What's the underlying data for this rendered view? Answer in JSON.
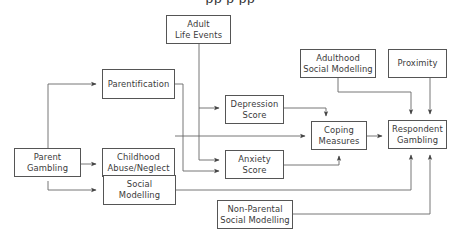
{
  "caption": "pp                  p                  pp",
  "colors": {
    "line": "#555555",
    "text": "#3a3a3a",
    "background": "#ffffff"
  },
  "nodes": {
    "adult_life_events": {
      "label": "Adult\nLife Events"
    },
    "parentification": {
      "label": "Parentification"
    },
    "parent_gambling": {
      "label": "Parent\nGambling"
    },
    "childhood_abuse": {
      "label": "Childhood\nAbuse/Neglect"
    },
    "social_modelling": {
      "label": "Social\nModelling"
    },
    "depression_score": {
      "label": "Depression\nScore"
    },
    "anxiety_score": {
      "label": "Anxiety\nScore"
    },
    "coping_measures": {
      "label": "Coping\nMeasures"
    },
    "respondent_gambling": {
      "label": "Respondent\nGambling"
    },
    "adulthood_social_modelling": {
      "label": "Adulthood\nSocial Modelling"
    },
    "proximity": {
      "label": "Proximity"
    },
    "non_parental_social_modelling": {
      "label": "Non-Parental\nSocial Modelling"
    }
  },
  "edges": [
    {
      "from": "Parent Gambling",
      "to": "Parentification"
    },
    {
      "from": "Parent Gambling",
      "to": "Childhood Abuse/Neglect"
    },
    {
      "from": "Parent Gambling",
      "to": "Social Modelling"
    },
    {
      "from": "Adult Life Events",
      "to": "Depression Score"
    },
    {
      "from": "Adult Life Events",
      "to": "Anxiety Score"
    },
    {
      "from": "Parentification",
      "to": "Anxiety Score"
    },
    {
      "from": "Childhood Abuse/Neglect",
      "to": "Coping Measures"
    },
    {
      "from": "Depression Score",
      "to": "Coping Measures"
    },
    {
      "from": "Anxiety Score",
      "to": "Coping Measures"
    },
    {
      "from": "Coping Measures",
      "to": "Respondent Gambling"
    },
    {
      "from": "Adulthood Social Modelling",
      "to": "Respondent Gambling"
    },
    {
      "from": "Proximity",
      "to": "Respondent Gambling"
    },
    {
      "from": "Social Modelling",
      "to": "Respondent Gambling"
    },
    {
      "from": "Non-Parental Social Modelling",
      "to": "Respondent Gambling"
    }
  ]
}
